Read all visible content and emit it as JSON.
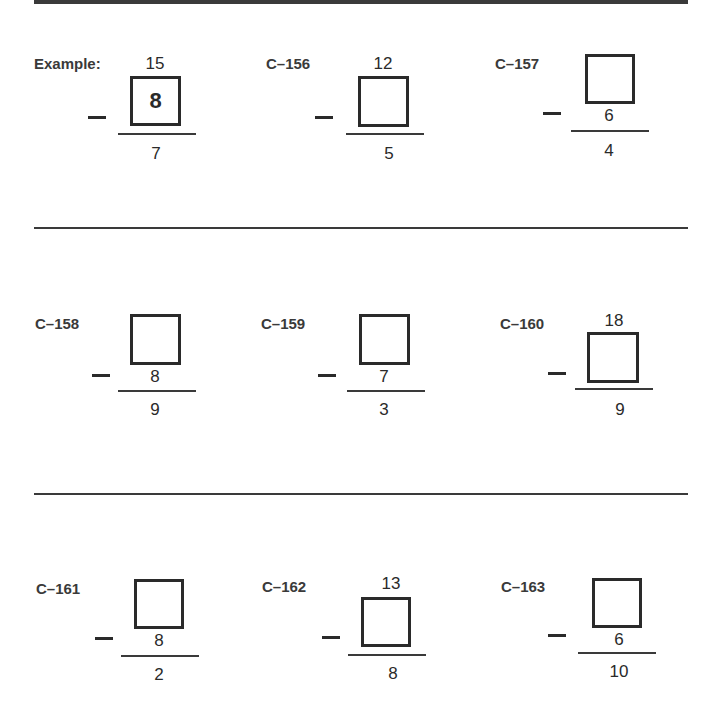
{
  "worksheet": {
    "operation_symbol": "minus",
    "rows": [
      [
        {
          "id": "Example:",
          "top": "15",
          "box": "8",
          "subtrahend": "",
          "answer": "7",
          "box_position": "subtrahend"
        },
        {
          "id": "C–156",
          "top": "12",
          "box": "",
          "subtrahend": "",
          "answer": "5",
          "box_position": "subtrahend"
        },
        {
          "id": "C–157",
          "top": "",
          "box": "",
          "subtrahend": "6",
          "answer": "4",
          "box_position": "top"
        }
      ],
      [
        {
          "id": "C–158",
          "top": "",
          "box": "",
          "subtrahend": "8",
          "answer": "9",
          "box_position": "top"
        },
        {
          "id": "C–159",
          "top": "",
          "box": "",
          "subtrahend": "7",
          "answer": "3",
          "box_position": "top"
        },
        {
          "id": "C–160",
          "top": "18",
          "box": "",
          "subtrahend": "",
          "answer": "9",
          "box_position": "subtrahend"
        }
      ],
      [
        {
          "id": "C–161",
          "top": "",
          "box": "",
          "subtrahend": "8",
          "answer": "2",
          "box_position": "top"
        },
        {
          "id": "C–162",
          "top": "13",
          "box": "",
          "subtrahend": "",
          "answer": "8",
          "box_position": "subtrahend"
        },
        {
          "id": "C–163",
          "top": "",
          "box": "",
          "subtrahend": "6",
          "answer": "10",
          "box_position": "top"
        }
      ]
    ]
  }
}
